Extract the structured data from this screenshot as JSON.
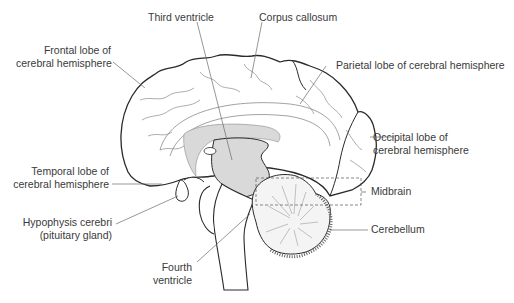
{
  "diagram": {
    "colors": {
      "outline": "#2a2a2a",
      "sulci": "#8a8a8a",
      "shade": "#d9d9d9",
      "leader": "#6a6a6a",
      "text": "#3a3a3a",
      "background": "#ffffff"
    },
    "labels": {
      "third_ventricle": "Third ventricle",
      "corpus_callosum": "Corpus callosum",
      "frontal_lobe": [
        "Frontal lobe of",
        "cerebral hemisphere"
      ],
      "parietal_lobe": "Parietal lobe of cerebral hemisphere",
      "occipital_lobe": [
        "Occipital lobe of",
        "cerebral hemisphere"
      ],
      "temporal_lobe": [
        "Temporal lobe of",
        "cerebral hemisphere"
      ],
      "hypophysis": [
        "Hypophysis cerebri",
        "(pituitary gland)"
      ],
      "midbrain": "Midbrain",
      "cerebellum": "Cerebellum",
      "fourth_ventricle": [
        "Fourth",
        "ventricle"
      ]
    }
  }
}
